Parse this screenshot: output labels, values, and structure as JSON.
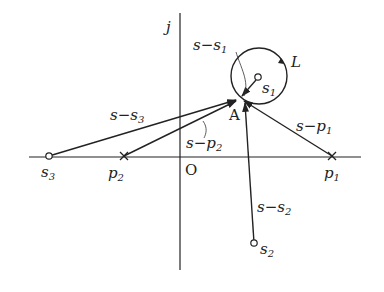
{
  "diagram": {
    "type": "complex-plane vector diagram",
    "axes": {
      "imaginary_label": "j",
      "origin_label": "O"
    },
    "points": {
      "A": {
        "label": "A",
        "kind": "evaluation point"
      },
      "s1": {
        "label": "s",
        "sub": "1",
        "kind": "zero"
      },
      "s2": {
        "label": "s",
        "sub": "2",
        "kind": "zero"
      },
      "s3": {
        "label": "s",
        "sub": "3",
        "kind": "zero"
      },
      "p1": {
        "label": "p",
        "sub": "1",
        "kind": "pole"
      },
      "p2": {
        "label": "p",
        "sub": "2",
        "kind": "pole"
      }
    },
    "contour": {
      "label": "L",
      "direction": "clockwise"
    },
    "vectors": [
      {
        "id": "s-s1",
        "pre": "s−s",
        "sub": "1"
      },
      {
        "id": "s-s2",
        "pre": "s−s",
        "sub": "2"
      },
      {
        "id": "s-s3",
        "pre": "s−s",
        "sub": "3"
      },
      {
        "id": "s-p1",
        "pre": "s−p",
        "sub": "1"
      },
      {
        "id": "s-p2",
        "pre": "s−p",
        "sub": "2"
      }
    ],
    "colors": {
      "ink": "#222222",
      "background": "#ffffff"
    }
  }
}
